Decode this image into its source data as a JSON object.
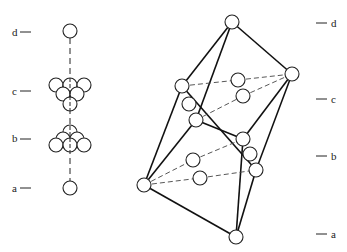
{
  "figure": {
    "type": "crystal-structure-diagram",
    "left_panel": {
      "layer_labels": [
        {
          "id": "d",
          "text": "d"
        },
        {
          "id": "c",
          "text": "c"
        },
        {
          "id": "b",
          "text": "b"
        },
        {
          "id": "a",
          "text": "a"
        }
      ],
      "description": "Stacking view along body diagonal: single atom (d), triangle of 6 atoms (c), triangle of 6 atoms (b), single atom (a)"
    },
    "right_panel": {
      "layer_labels": [
        {
          "id": "d",
          "text": "d"
        },
        {
          "id": "c",
          "text": "c"
        },
        {
          "id": "b",
          "text": "b"
        },
        {
          "id": "a",
          "text": "a"
        }
      ],
      "description": "Rhombohedral unit cell with corner atoms joined by solid edges and inner atoms joined by dashed lines"
    }
  }
}
